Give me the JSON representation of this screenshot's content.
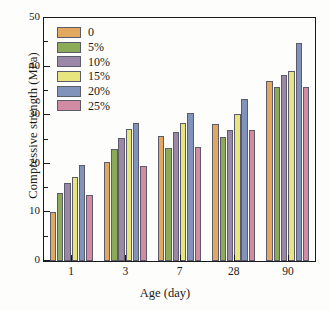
{
  "chart_data": {
    "type": "bar",
    "title": "",
    "subtitle": "",
    "xlabel": "Age (day)",
    "ylabel": "Compressive strength (MPa)",
    "categories": [
      "1",
      "3",
      "7",
      "28",
      "90"
    ],
    "ylim": [
      0,
      50
    ],
    "yticks": [
      0,
      10,
      20,
      30,
      40,
      50
    ],
    "ytick_labels": [
      "0",
      "10",
      "20",
      "30",
      "40",
      "50"
    ],
    "yminor_step": 5,
    "grid": false,
    "legend_position": "top-left",
    "series": [
      {
        "name": "0",
        "color": "#e3a860",
        "values": [
          10.0,
          20.3,
          25.8,
          28.2,
          37.1
        ]
      },
      {
        "name": "5%",
        "color": "#8bab58",
        "values": [
          14.0,
          23.0,
          23.3,
          25.6,
          35.8
        ]
      },
      {
        "name": "10%",
        "color": "#9b88a8",
        "values": [
          16.0,
          25.3,
          26.6,
          27.0,
          38.2
        ]
      },
      {
        "name": "15%",
        "color": "#e8e57f",
        "values": [
          17.2,
          27.2,
          28.4,
          30.2,
          39.1
        ]
      },
      {
        "name": "20%",
        "color": "#8193ba",
        "values": [
          19.8,
          28.5,
          30.5,
          33.3,
          44.8
        ]
      },
      {
        "name": "25%",
        "color": "#d18ba3",
        "values": [
          13.5,
          19.5,
          23.5,
          27.0,
          35.8
        ]
      }
    ]
  },
  "axes": {
    "y_title": "Compressive strength (MPa)",
    "x_title": "Age (day)"
  }
}
